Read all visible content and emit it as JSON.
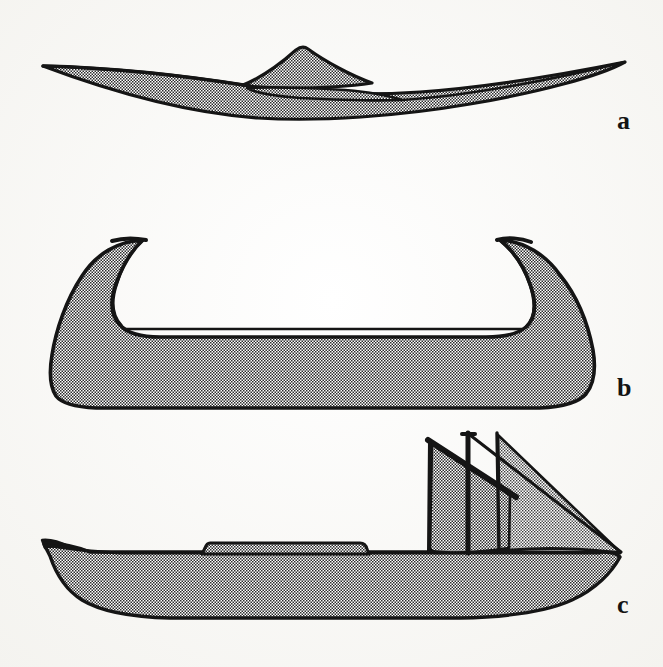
{
  "plate": {
    "title": "Three watercraft profile drawings",
    "background_color": "#fdfdfb",
    "ink_color": "#141414",
    "fill_tone": "#9a9a9a",
    "width": 663,
    "height": 667
  },
  "figures": [
    {
      "id": "a",
      "label": "a",
      "name": "kayak-with-raised-cockpit-coaming",
      "description": "Low slender double-ended hull, sheer curving up to sharp points at both ends, with a peaked raised cockpit structure amidships",
      "label_position": {
        "x": 617,
        "y": 108
      }
    },
    {
      "id": "b",
      "label": "b",
      "name": "canoe-with-inward-hooked-ends",
      "description": "Flat-bottomed hull with tall prow and stern that curl sharply inward toward the centre, forming hook shapes",
      "label_position": {
        "x": 617,
        "y": 375
      }
    },
    {
      "id": "c",
      "label": "c",
      "name": "sailing-boat-with-deckhouse-and-two-sails",
      "description": "Long hull with upswept bow, low trapezoidal deckhouse amidships, vertical mast carrying a square sail on a slanted yard and a large triangular sail running aft to the stern",
      "label_position": {
        "x": 617,
        "y": 592
      }
    }
  ],
  "figure_c_parts": [
    {
      "name": "hull",
      "label": "hull"
    },
    {
      "name": "deckhouse",
      "label": "deckhouse"
    },
    {
      "name": "mast",
      "label": "mast"
    },
    {
      "name": "yard",
      "label": "yard"
    },
    {
      "name": "square-sail",
      "label": "square sail"
    },
    {
      "name": "triangular-sail",
      "label": "triangular sail"
    }
  ]
}
